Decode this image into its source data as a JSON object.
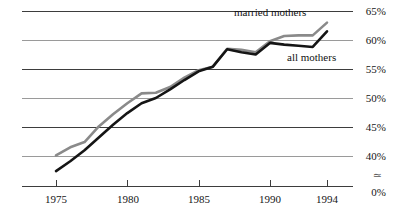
{
  "chart_data": {
    "type": "line",
    "title": "",
    "subtitle": "",
    "xlabel": "",
    "ylabel": "",
    "xlim": [
      1974,
      1995
    ],
    "ylim": [
      37,
      66
    ],
    "grid": true,
    "grid_orientation": "horizontal",
    "legend_position": "inline-annotations",
    "axis_break": {
      "present": true,
      "symbol": "≈",
      "between": [
        0,
        40
      ]
    },
    "x_tick_labels": [
      "1975",
      "1980",
      "1985",
      "1990",
      "1994"
    ],
    "x_tick_values": [
      1975,
      1980,
      1985,
      1990,
      1994
    ],
    "y_tick_labels": [
      "65%",
      "60%",
      "55%",
      "50%",
      "45%",
      "40%",
      "0%"
    ],
    "y_tick_values": [
      65,
      60,
      55,
      50,
      45,
      40,
      0
    ],
    "x": [
      1975,
      1976,
      1977,
      1978,
      1979,
      1980,
      1981,
      1982,
      1983,
      1984,
      1985,
      1986,
      1987,
      1988,
      1989,
      1990,
      1991,
      1992,
      1993,
      1994
    ],
    "series": [
      {
        "name": "married mothers",
        "color": "#8a8a8a",
        "values": [
          40.1,
          41.5,
          42.4,
          45.1,
          47.2,
          49.1,
          50.8,
          50.9,
          51.9,
          53.5,
          54.8,
          55.4,
          58.5,
          58.3,
          57.9,
          59.8,
          60.7,
          60.8,
          60.8,
          63.0
        ]
      },
      {
        "name": "all mothers",
        "color": "#151515",
        "values": [
          37.4,
          39.1,
          41.0,
          43.2,
          45.4,
          47.4,
          49.1,
          50.0,
          51.5,
          53.1,
          54.6,
          55.4,
          58.4,
          57.9,
          57.5,
          59.5,
          59.2,
          59.0,
          58.8,
          61.5
        ]
      }
    ],
    "annotations": [
      {
        "name": "married mothers",
        "text": "married mothers",
        "x_px": 234,
        "y_px": 13
      },
      {
        "name": "all mothers",
        "text": "all mothers",
        "x_px": 287,
        "y_px": 58
      }
    ]
  },
  "axis": {
    "y_labels": [
      {
        "text": "65%",
        "y_px": 6
      },
      {
        "text": "60%",
        "y_px": 35
      },
      {
        "text": "55%",
        "y_px": 64
      },
      {
        "text": "50%",
        "y_px": 93
      },
      {
        "text": "45%",
        "y_px": 122
      },
      {
        "text": "40%",
        "y_px": 151
      },
      {
        "text": "0%",
        "y_px": 187
      }
    ],
    "break_symbol": "≃",
    "x_labels": [
      {
        "text": "1975",
        "x_px": 56
      },
      {
        "text": "1980",
        "x_px": 128
      },
      {
        "text": "1985",
        "x_px": 199
      },
      {
        "text": "1990",
        "x_px": 270
      },
      {
        "text": "1994",
        "x_px": 327
      }
    ]
  }
}
